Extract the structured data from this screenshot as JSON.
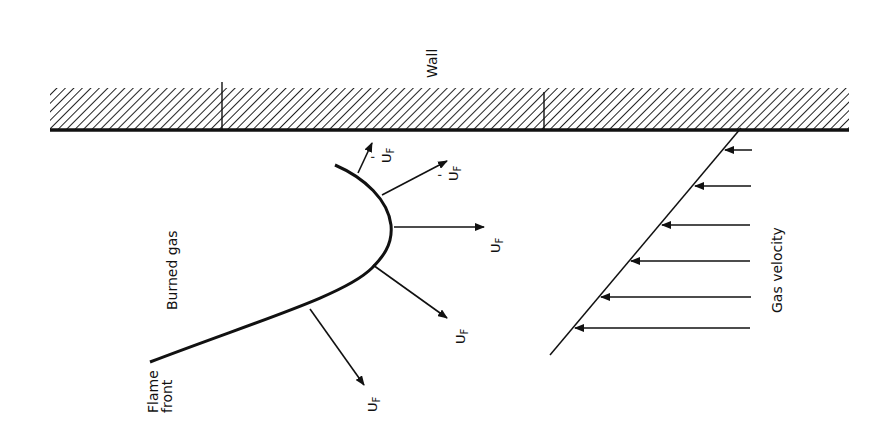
{
  "diagram": {
    "labels": {
      "wall": "Wall",
      "burned_gas": "Burned gas",
      "flame_front_line1": "Flame",
      "flame_front_line2": "front",
      "gas_velocity": "Gas velocity",
      "uf": "U",
      "uf_sub": "F",
      "uf_prime": "U",
      "uf_prime_sub": "F",
      "prime_mark": "'"
    },
    "flame_velocity_vectors": [
      {
        "label": "U'F",
        "primed": true
      },
      {
        "label": "U'F",
        "primed": true
      },
      {
        "label": "UF",
        "primed": false
      },
      {
        "label": "UF",
        "primed": false
      },
      {
        "label": "UF",
        "primed": false
      }
    ],
    "gas_velocity_arrows_count": 6,
    "colors": {
      "ink": "#111111",
      "background": "#ffffff"
    }
  }
}
